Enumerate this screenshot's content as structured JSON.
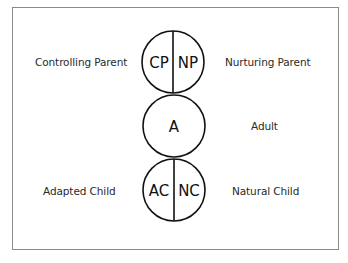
{
  "diagram": {
    "nodes": [
      {
        "id": "parent",
        "shape": "split-circle",
        "left_abbrev": "CP",
        "right_abbrev": "NP",
        "left_label": "Controlling Parent",
        "right_label": "Nurturing Parent"
      },
      {
        "id": "adult",
        "shape": "circle",
        "abbrev": "A",
        "right_label": "Adult"
      },
      {
        "id": "child",
        "shape": "split-circle",
        "left_abbrev": "AC",
        "right_abbrev": "NC",
        "left_label": "Adapted Child",
        "right_label": "Natural Child"
      }
    ],
    "edges": [
      {
        "from": "parent",
        "to": "adult",
        "type": "touching"
      },
      {
        "from": "adult",
        "to": "child",
        "type": "touching"
      }
    ],
    "colors": {
      "stroke": "#111111",
      "frame": "#8a8a8a",
      "text": "#2a2a2a",
      "background": "#ffffff"
    }
  }
}
